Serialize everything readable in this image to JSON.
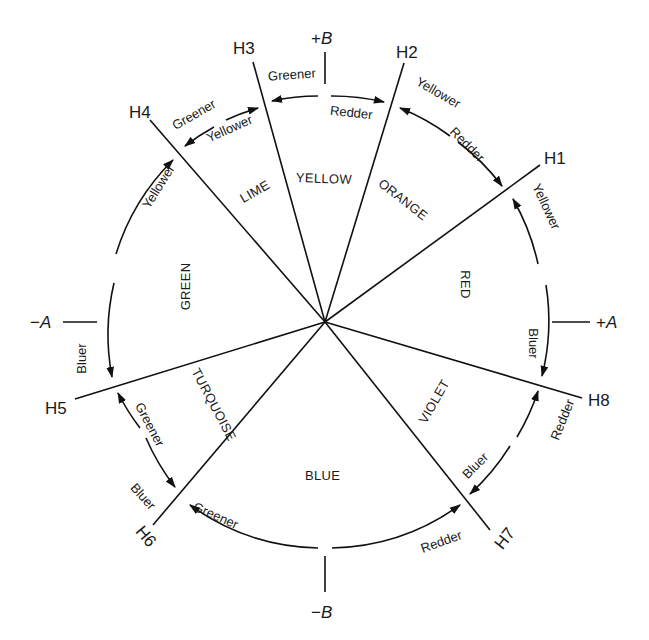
{
  "diagram": {
    "type": "hue-circle",
    "axes": {
      "plus_b": {
        "sign": "+",
        "letter": "B"
      },
      "minus_b": {
        "sign": "−",
        "letter": "B"
      },
      "plus_a": {
        "sign": "+",
        "letter": "A"
      },
      "minus_a": {
        "sign": "−",
        "letter": "A"
      }
    },
    "boundaries": [
      {
        "id": "H1",
        "label": "H1"
      },
      {
        "id": "H2",
        "label": "H2"
      },
      {
        "id": "H3",
        "label": "H3"
      },
      {
        "id": "H4",
        "label": "H4"
      },
      {
        "id": "H5",
        "label": "H5"
      },
      {
        "id": "H6",
        "label": "H6"
      },
      {
        "id": "H7",
        "label": "H7"
      },
      {
        "id": "H8",
        "label": "H8"
      }
    ],
    "hues": {
      "yellow": "YELLOW",
      "orange": "ORANGE",
      "red": "RED",
      "violet": "VIOLET",
      "blue": "BLUE",
      "turquoise": "TURQUOISE",
      "green": "GREEN",
      "lime": "LIME"
    },
    "arrow_labels": {
      "top_left_greener": "Greener",
      "top_right_redder": "Redder",
      "h2_yellower": "Yellower",
      "h1_redder": "Redder",
      "h1_yellower": "Yellower",
      "h8_bluer": "Bluer",
      "h8_redder": "Redder",
      "h7_bluer": "Bluer",
      "h7_redder": "Redder",
      "h6_greener": "Greener",
      "h6_bluer": "Bluer",
      "h5_greener": "Greener",
      "h5_bluer": "Bluer",
      "h4_yellower": "Yellower",
      "h4_greener": "Greener",
      "h3_yellower": "Yellower"
    }
  }
}
